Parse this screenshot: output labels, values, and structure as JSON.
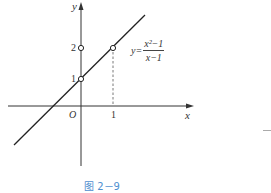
{
  "figure": {
    "caption": "图 2－9",
    "axis_x_label": "x",
    "axis_y_label": "y",
    "origin_label": "O",
    "tick_x_1": "1",
    "tick_y_1": "1",
    "tick_y_2": "2",
    "equation": {
      "lhs": "y=",
      "numerator": "x²−1",
      "denominator": "x−1"
    },
    "points": [
      {
        "name": "(0,1)",
        "type": "open-circle"
      },
      {
        "name": "(0,2)",
        "type": "open-circle"
      },
      {
        "name": "(1,2)",
        "type": "open-circle"
      }
    ],
    "colors": {
      "line": "#222222",
      "caption": "#4f8fcf"
    }
  }
}
